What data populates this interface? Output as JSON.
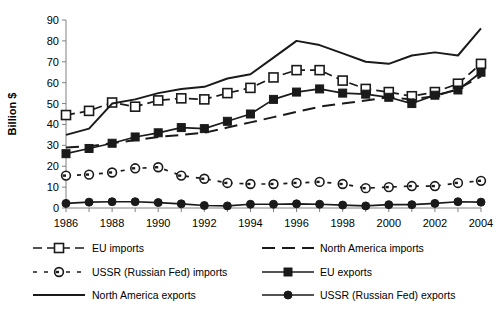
{
  "chart_data": {
    "type": "line",
    "title": "",
    "xlabel": "",
    "ylabel": "Billion $",
    "ylim": [
      0,
      90
    ],
    "yticks": [
      0,
      10,
      20,
      30,
      40,
      50,
      60,
      70,
      80,
      90
    ],
    "grid": false,
    "legend_position": "bottom",
    "categories": [
      1986,
      1987,
      1988,
      1989,
      1990,
      1991,
      1992,
      1993,
      1994,
      1995,
      1996,
      1997,
      1998,
      1999,
      2000,
      2001,
      2002,
      2003,
      2004
    ],
    "xtick_labels": [
      "1986",
      "1987",
      "1988",
      "1989",
      "1990",
      "1991",
      "1992",
      "1993",
      "1994",
      "1995",
      "1996",
      "1997",
      "1998",
      "1999",
      "2000",
      "2001",
      "2002",
      "2003",
      "2004"
    ],
    "xticks_shown": [
      "1986",
      "1988",
      "1990",
      "1992",
      "1994",
      "1996",
      "1998",
      "2000",
      "2002",
      "2004"
    ],
    "series": [
      {
        "name": "EU imports",
        "marker": "open-square",
        "line": "dashed",
        "values": [
          44.5,
          46.5,
          50.5,
          48.5,
          51.5,
          52.5,
          52.0,
          55.0,
          57.5,
          62.5,
          66.0,
          66.0,
          61.0,
          57.0,
          55.5,
          53.5,
          55.5,
          59.5,
          69.0
        ]
      },
      {
        "name": "North America imports",
        "marker": "none",
        "line": "dashed",
        "values": [
          29.0,
          29.5,
          31.0,
          32.5,
          34.0,
          35.0,
          36.0,
          38.5,
          41.0,
          43.5,
          46.0,
          48.5,
          50.0,
          51.5,
          53.0,
          52.0,
          53.5,
          57.0,
          63.0
        ]
      },
      {
        "name": "USSR (Russian Fed) imports",
        "marker": "open-circle-dot",
        "line": "dashed",
        "values": [
          15.5,
          16.0,
          17.0,
          19.0,
          19.5,
          15.5,
          14.0,
          12.0,
          11.5,
          11.5,
          12.0,
          12.5,
          11.5,
          9.5,
          10.0,
          10.5,
          10.5,
          12.0,
          13.0
        ]
      },
      {
        "name": "EU exports",
        "marker": "filled-square",
        "line": "solid",
        "values": [
          26.0,
          28.5,
          31.0,
          34.0,
          36.0,
          38.5,
          38.0,
          41.5,
          45.0,
          52.0,
          55.5,
          57.0,
          55.0,
          54.5,
          53.0,
          50.0,
          54.0,
          56.5,
          65.0
        ]
      },
      {
        "name": "North America exports",
        "marker": "none",
        "line": "solid",
        "values": [
          35.0,
          38.0,
          50.0,
          52.0,
          55.0,
          57.0,
          58.0,
          62.0,
          64.0,
          72.0,
          80.0,
          78.0,
          74.0,
          70.0,
          69.0,
          73.0,
          74.5,
          73.0,
          86.0
        ]
      },
      {
        "name": "USSR (Russian Fed) exports",
        "marker": "filled-circle",
        "line": "solid",
        "values": [
          2.2,
          2.8,
          3.0,
          3.0,
          2.6,
          2.0,
          1.2,
          1.0,
          1.8,
          1.8,
          2.0,
          1.8,
          1.4,
          1.0,
          1.6,
          1.6,
          2.2,
          3.0,
          2.8
        ]
      }
    ],
    "legend": [
      {
        "label": "EU imports",
        "marker": "open-square",
        "line": "dashed"
      },
      {
        "label": "North America imports",
        "marker": "none",
        "line": "dashed"
      },
      {
        "label": "USSR (Russian Fed) imports",
        "marker": "open-circle-dot",
        "line": "dashed"
      },
      {
        "label": "EU exports",
        "marker": "filled-square",
        "line": "solid"
      },
      {
        "label": "North America exports",
        "marker": "none",
        "line": "solid"
      },
      {
        "label": "USSR (Russian Fed) exports",
        "marker": "filled-circle",
        "line": "solid"
      }
    ],
    "colors": {
      "ink": "#1a1a1a",
      "axis": "#808080",
      "background": "#ffffff"
    }
  }
}
